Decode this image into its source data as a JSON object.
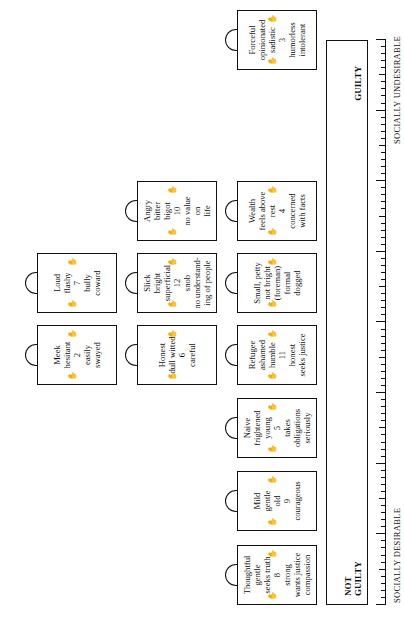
{
  "diagram": {
    "orientation": "rotated 90 degrees counter-clockwise",
    "scale": {
      "left_label": "SOCIALLY DESIRABLE",
      "right_label": "SOCIALLY UNDESIRABLE"
    },
    "verdict_bar": {
      "left": "NOT\nGUILTY",
      "right": "GUILTY"
    },
    "cards": [
      {
        "id": 8,
        "text": "Thoughtful\ngentle\nseeks truth\n8\nstrong\nwants justice\ncompassion",
        "column": 1,
        "row": 1
      },
      {
        "id": 9,
        "text": "Mild\ngentle\nold\n9\ncourageous",
        "column": 2,
        "row": 1
      },
      {
        "id": 5,
        "text": "Naive\nfrightened\nyoung\n5\ntakes\nobligations\nseriously",
        "column": 3,
        "row": 1
      },
      {
        "id": 11,
        "text": "Refugee\nashamed\nhumble\n11\nhonest\nseeks justice",
        "column": 4,
        "row": 1
      },
      {
        "id": 6,
        "text": "Honest\ndull witted\n6\ncareful",
        "column": 4,
        "row": 2
      },
      {
        "id": 2,
        "text": "Meek\nhesitant\n2\neasily\nswayed",
        "column": 4,
        "row": 3
      },
      {
        "id": 1,
        "text": "Small, petty\nnot bright\n(foreman)\nformal\ndogged",
        "column": 5,
        "row": 1
      },
      {
        "id": 12,
        "text": "Slick\nbright\nsuperficial\n12\nsnob\nno understand-\ning of people",
        "column": 5,
        "row": 2
      },
      {
        "id": 7,
        "text": "Loud\nflashy\n7\nbully\ncoward",
        "column": 5,
        "row": 3
      },
      {
        "id": 4,
        "text": "Wealth\nfeels above rest\n4\nconcerned\nwith facts",
        "column": 6,
        "row": 1
      },
      {
        "id": 10,
        "text": "Angry\nbitter\nbigot\n10\nno value\non\nlife",
        "column": 6,
        "row": 2
      },
      {
        "id": 3,
        "text": "Forceful\nopinionated\nsadistic\n3\nhumorless\nintolerant",
        "column": 7,
        "row": 1
      }
    ],
    "icons": [
      "handle-icon",
      "hand-icon"
    ]
  }
}
